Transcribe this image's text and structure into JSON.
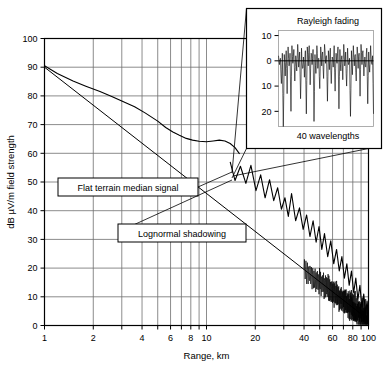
{
  "chart_data": {
    "type": "line",
    "title": "",
    "xlabel": "Range, km",
    "ylabel": "dB µV/m field strength",
    "xscale": "log",
    "xlim": [
      1,
      100
    ],
    "ylim": [
      0,
      100
    ],
    "xticks": [
      1,
      2,
      4,
      6,
      8,
      10,
      20,
      40,
      60,
      80,
      100
    ],
    "xtick_labels": [
      "1",
      "2",
      "4",
      "6",
      "8",
      "10",
      "20",
      "40",
      "60",
      "80",
      "100"
    ],
    "yticks": [
      0,
      10,
      20,
      30,
      40,
      50,
      60,
      70,
      80,
      90,
      100
    ],
    "ytick_labels": [
      "0",
      "10",
      "20",
      "30",
      "40",
      "50",
      "60",
      "70",
      "80",
      "90",
      "100"
    ],
    "grid": true,
    "legend_position": "none",
    "series": [
      {
        "name": "Flat terrain median signal",
        "type": "line",
        "points": [
          [
            1.0,
            90.5
          ],
          [
            1.2,
            87.8
          ],
          [
            1.5,
            85.2
          ],
          [
            1.8,
            83.4
          ],
          [
            2.2,
            81.5
          ],
          [
            2.6,
            79.8
          ],
          [
            3.0,
            78.2
          ],
          [
            3.6,
            76.2
          ],
          [
            4.2,
            74.0
          ],
          [
            5.0,
            71.2
          ],
          [
            5.6,
            69.0
          ],
          [
            6.2,
            67.4
          ],
          [
            6.8,
            66.3
          ],
          [
            7.5,
            65.2
          ],
          [
            8.2,
            64.6
          ],
          [
            9.0,
            64.2
          ],
          [
            10.0,
            64.0
          ],
          [
            11.0,
            64.3
          ],
          [
            12.0,
            64.6
          ],
          [
            13.0,
            64.3
          ],
          [
            14.0,
            63.4
          ],
          [
            15.0,
            62.0
          ],
          [
            16.0,
            59.8
          ]
        ]
      },
      {
        "name": "Free space / mean path loss reference line",
        "type": "line",
        "points": [
          [
            1.0,
            90.0
          ],
          [
            100.0,
            2.0
          ]
        ]
      },
      {
        "name": "Lognormal shadowing",
        "type": "line",
        "description": "Slow-fading envelope oscillating about the mean path-loss line, amplitude ~8 dB, increasing spatial frequency with range",
        "points": [
          [
            14.0,
            57.0
          ],
          [
            15.0,
            50.5
          ],
          [
            16.2,
            55.5
          ],
          [
            17.5,
            49.5
          ],
          [
            18.8,
            55.8
          ],
          [
            20.2,
            47.0
          ],
          [
            21.6,
            52.5
          ],
          [
            23.0,
            44.5
          ],
          [
            24.5,
            50.8
          ],
          [
            26.0,
            43.5
          ],
          [
            27.5,
            48.0
          ],
          [
            29.0,
            40.5
          ],
          [
            30.5,
            44.5
          ],
          [
            32.0,
            38.0
          ],
          [
            33.5,
            46.0
          ],
          [
            35.5,
            36.5
          ],
          [
            37.5,
            41.0
          ],
          [
            39.5,
            33.5
          ],
          [
            41.5,
            38.5
          ],
          [
            43.5,
            31.0
          ],
          [
            45.5,
            36.5
          ],
          [
            47.5,
            29.0
          ],
          [
            49.5,
            34.5
          ],
          [
            51.5,
            26.5
          ],
          [
            53.5,
            32.0
          ],
          [
            56.0,
            24.0
          ],
          [
            58.5,
            29.5
          ],
          [
            61.0,
            21.5
          ],
          [
            63.5,
            26.5
          ],
          [
            66.0,
            19.0
          ],
          [
            68.5,
            24.0
          ],
          [
            71.0,
            16.5
          ],
          [
            73.5,
            21.5
          ],
          [
            76.0,
            14.0
          ],
          [
            78.5,
            19.0
          ],
          [
            81.0,
            11.5
          ],
          [
            83.5,
            16.5
          ],
          [
            86.0,
            9.0
          ],
          [
            88.5,
            14.0
          ],
          [
            91.0,
            6.5
          ],
          [
            93.5,
            11.0
          ],
          [
            96.0,
            4.0
          ],
          [
            98.0,
            8.5
          ],
          [
            100.0,
            2.0
          ]
        ]
      }
    ],
    "annotations": [
      {
        "label": "Flat terrain median signal",
        "target_x": 11.5,
        "target_y": 58.0
      },
      {
        "label": "Lognormal shadowing",
        "target_x": 16.5,
        "target_y": 52.0
      }
    ],
    "inset": {
      "title": "Rayleigh fading",
      "xlabel": "40 wavelengths",
      "ylabel": "",
      "yticks": [
        10,
        0,
        -10,
        -20
      ],
      "ytick_labels": [
        "10",
        "0",
        "10",
        "20"
      ],
      "ylim": [
        -26,
        12
      ],
      "zero_line": 0,
      "type": "line",
      "description": "Fast fading envelope in dB relative to mean, deep nulls to -25 dB, peaks to +7 dB",
      "values": [
        2.0,
        -1.5,
        1.0,
        -9.0,
        3.0,
        -26.0,
        2.5,
        -6.0,
        4.0,
        -13.0,
        5.5,
        -2.0,
        3.0,
        -20.0,
        6.0,
        -1.0,
        4.5,
        -8.0,
        2.0,
        -4.0,
        6.5,
        -2.5,
        3.5,
        -15.0,
        5.0,
        -3.0,
        1.5,
        -6.5,
        4.0,
        -21.0,
        5.5,
        -2.0,
        6.0,
        -9.5,
        3.0,
        -1.5,
        4.5,
        -24.0,
        2.5,
        -5.0,
        6.0,
        -3.0,
        1.0,
        -11.0,
        5.5,
        -2.0,
        3.5,
        -7.0,
        6.5,
        -1.0,
        2.0,
        -16.0,
        4.0,
        -3.5,
        5.0,
        -9.0,
        1.5,
        -2.5,
        6.0,
        -12.0,
        3.0,
        -1.0,
        5.5,
        -19.0,
        4.5,
        -4.0,
        2.0,
        -7.5,
        6.5,
        -2.0,
        3.5,
        -10.0,
        5.0,
        -1.5,
        1.0,
        -22.0,
        4.0,
        -5.5,
        6.0,
        -2.0,
        2.5,
        -8.0,
        5.5,
        -3.0,
        3.0,
        -14.0,
        6.5,
        -1.5,
        4.0,
        -6.0,
        1.5,
        -2.5,
        5.0,
        -17.0,
        3.5,
        -4.5,
        6.0,
        -1.0,
        2.0,
        -21.0
      ]
    }
  },
  "axes": {
    "x_title": "Range, km",
    "y_title": "dB µV/m field strength"
  },
  "colors": {
    "line": "#000000",
    "grid": "#6e6e6e",
    "background": "#ffffff",
    "frame": "#000000"
  }
}
